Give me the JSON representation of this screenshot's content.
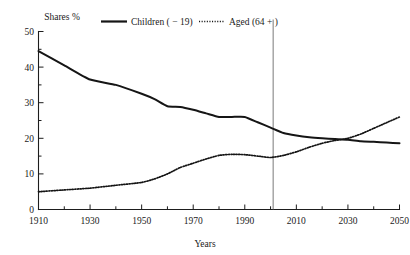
{
  "chart_data": {
    "type": "line",
    "title": "",
    "xlabel": "Years",
    "ylabel": "Shares %",
    "xlim": [
      1910,
      2050
    ],
    "ylim": [
      0,
      50
    ],
    "grid": false,
    "legend_position": "top",
    "x_ticks": [
      "1910",
      "1930",
      "1950",
      "1970",
      "1990",
      "2010",
      "2030",
      "2050"
    ],
    "x_tick_values": [
      1910,
      1930,
      1950,
      1970,
      1990,
      2010,
      2030,
      2050
    ],
    "x_minor_step": 10,
    "y_ticks": [
      "0",
      "10",
      "20",
      "30",
      "40",
      "50"
    ],
    "y_tick_values": [
      0,
      10,
      20,
      30,
      40,
      50
    ],
    "y_minor_step": 5,
    "annotations": [
      {
        "name": "present-year-marker",
        "type": "vertical-line",
        "x": 2001,
        "label": ""
      }
    ],
    "x": [
      1910,
      1920,
      1930,
      1940,
      1950,
      1955,
      1960,
      1965,
      1970,
      1975,
      1980,
      1985,
      1990,
      1995,
      2000,
      2005,
      2010,
      2015,
      2020,
      2025,
      2030,
      2035,
      2040,
      2045,
      2050
    ],
    "series": [
      {
        "name": "Children ( − 19)",
        "style": "solid",
        "values": [
          44.5,
          40.5,
          36.5,
          35.0,
          32.5,
          31.0,
          29.0,
          28.8,
          28.0,
          27.0,
          26.0,
          26.0,
          26.0,
          24.5,
          23.0,
          21.5,
          20.8,
          20.3,
          20.0,
          19.8,
          19.6,
          19.2,
          19.0,
          18.8,
          18.6
        ]
      },
      {
        "name": "Aged (64 + )",
        "style": "dotted",
        "values": [
          5.0,
          5.5,
          6.0,
          6.8,
          7.6,
          8.6,
          10.0,
          11.8,
          13.0,
          14.2,
          15.2,
          15.5,
          15.4,
          15.0,
          14.6,
          15.2,
          16.2,
          17.5,
          18.6,
          19.4,
          20.0,
          21.2,
          22.8,
          24.4,
          26.0
        ]
      }
    ]
  },
  "legend": {
    "items": [
      {
        "label": "Children ( − 19)",
        "style": "solid"
      },
      {
        "label": "Aged (64 + )",
        "style": "dotted"
      }
    ]
  },
  "axes": {
    "y_title": "Shares %",
    "x_title": "Years"
  },
  "colors": {
    "line": "#151515",
    "axis": "#1d1d1d",
    "marker": "#6b6b6b",
    "background": "#ffffff"
  }
}
